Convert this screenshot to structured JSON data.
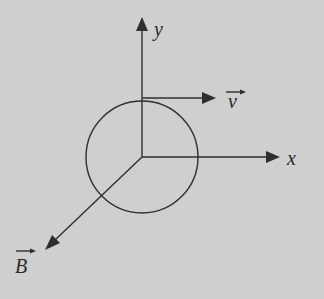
{
  "diagram": {
    "labels": {
      "y_axis": "y",
      "x_axis": "x",
      "velocity": "v",
      "magnetic_field": "B"
    },
    "colors": {
      "background": "#cfcfcf",
      "stroke": "#2e2e2e"
    }
  }
}
